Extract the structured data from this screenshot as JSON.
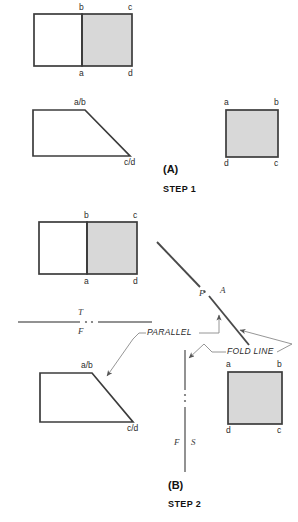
{
  "figure": {
    "title_a": "(A)",
    "title_b": "(B)",
    "step_1": "STEP 1",
    "step_2": "STEP 2",
    "colors": {
      "line": "#4a4a4a",
      "heavy_line": "#3c3c3c",
      "shade_fill": "#d8d8d8",
      "thin_leader": "#8a8a8a",
      "text": "#2b2b2b",
      "background": "#ffffff"
    }
  },
  "step1": {
    "top_view": {
      "name": "two-square-top-view",
      "labels": {
        "tl": "b",
        "tr": "c",
        "bl": "a",
        "br": "d"
      },
      "shaded_half": "right"
    },
    "front_view": {
      "name": "trapezoid-front-view",
      "labels": {
        "top": "a/b",
        "bottom": "c/d"
      }
    },
    "side_view": {
      "name": "square-side-view",
      "labels": {
        "tl": "a",
        "tr": "b",
        "bl": "d",
        "br": "c"
      },
      "shaded": true
    }
  },
  "step2": {
    "top_view": {
      "name": "two-square-top-view",
      "labels": {
        "tl": "b",
        "tr": "c",
        "bl": "a",
        "br": "d"
      },
      "shaded_half": "right"
    },
    "front_view": {
      "name": "trapezoid-front-view",
      "labels": {
        "top": "a/b",
        "bottom": "c/d"
      }
    },
    "aux_view": {
      "name": "square-auxiliary-view",
      "labels": {
        "tl": "a",
        "tr": "b",
        "bl": "d",
        "br": "c"
      },
      "shaded": true
    },
    "fold_lines": {
      "horizontal": {
        "above": "T",
        "below": "F"
      },
      "vertical": {
        "left": "F",
        "right": "S"
      },
      "diagonal": {
        "above_left": "F",
        "above_right": "A"
      }
    },
    "annotations": {
      "parallel": "PARALLEL",
      "fold_line": "FOLD LINE"
    }
  }
}
